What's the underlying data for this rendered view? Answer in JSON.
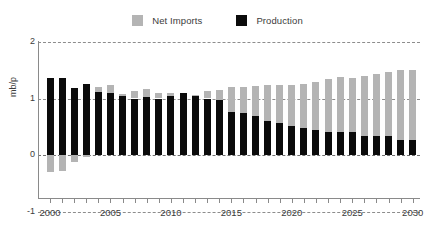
{
  "legend": {
    "entries": [
      {
        "label": "Net Imports",
        "color": "#b4b4b4",
        "swatch_name": "legend-swatch-net-imports"
      },
      {
        "label": "Production",
        "color": "#0b0b0b",
        "swatch_name": "legend-swatch-production"
      }
    ]
  },
  "chart_data": {
    "type": "bar",
    "stacked": true,
    "title": "",
    "subtitle": "",
    "xlabel": "",
    "ylabel": "mb/p",
    "ylim": [
      -1,
      2
    ],
    "xlim": [
      2000,
      2030
    ],
    "grid": true,
    "grid_style": "dashed-horizontal",
    "legend_position": "top-center",
    "ytick_labels": [
      "2",
      "1",
      "0",
      "-1"
    ],
    "ytick_values": [
      2,
      1,
      0,
      -1
    ],
    "xtick_labels": [
      "2000",
      "2005",
      "2010",
      "2015",
      "2020",
      "2025",
      "2030"
    ],
    "xtick_values": [
      2000,
      2005,
      2010,
      2015,
      2020,
      2025,
      2030
    ],
    "xtick_minor_every": 1,
    "categories": [
      "2000",
      "2001",
      "2002",
      "2003",
      "2004",
      "2005",
      "2006",
      "2007",
      "2008",
      "2009",
      "2010",
      "2011",
      "2012",
      "2013",
      "2014",
      "2015",
      "2016",
      "2017",
      "2018",
      "2019",
      "2020",
      "2021",
      "2022",
      "2023",
      "2024",
      "2025",
      "2026",
      "2027",
      "2028",
      "2029",
      "2030"
    ],
    "series": [
      {
        "name": "Production",
        "color": "#0b0b0b",
        "values": [
          1.37,
          1.37,
          1.18,
          1.26,
          1.11,
          1.1,
          1.04,
          1.0,
          1.02,
          1.0,
          1.05,
          1.09,
          1.06,
          1.0,
          0.98,
          0.76,
          0.74,
          0.69,
          0.61,
          0.57,
          0.52,
          0.48,
          0.45,
          0.41,
          0.41,
          0.4,
          0.34,
          0.34,
          0.34,
          0.27,
          0.27
        ]
      },
      {
        "name": "Net Imports",
        "color": "#b4b4b4",
        "values": [
          -0.3,
          -0.29,
          -0.13,
          -0.03,
          0.1,
          0.14,
          0.04,
          0.13,
          0.15,
          0.1,
          0.04,
          0.0,
          0.01,
          0.13,
          0.17,
          0.44,
          0.47,
          0.54,
          0.63,
          0.67,
          0.72,
          0.77,
          0.85,
          0.93,
          0.97,
          0.97,
          1.06,
          1.1,
          1.13,
          1.23,
          1.23
        ]
      }
    ],
    "totals": [
      1.07,
      1.08,
      1.05,
      1.23,
      1.21,
      1.24,
      1.08,
      1.13,
      1.17,
      1.1,
      1.09,
      1.09,
      1.07,
      1.13,
      1.15,
      1.2,
      1.21,
      1.23,
      1.24,
      1.24,
      1.24,
      1.25,
      1.3,
      1.34,
      1.38,
      1.37,
      1.4,
      1.44,
      1.47,
      1.5,
      1.5
    ]
  }
}
